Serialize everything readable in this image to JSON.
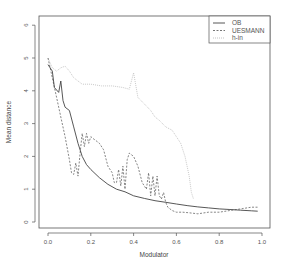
{
  "chart_data": {
    "type": "line",
    "title": "",
    "xlabel": "Modulator",
    "ylabel": "Mean distance",
    "xlim": [
      -0.04,
      1.04
    ],
    "ylim": [
      -0.24,
      6.24
    ],
    "x_ticks": [
      0.0,
      0.2,
      0.4,
      0.6,
      0.8,
      1.0
    ],
    "x_tick_labels": [
      "0.0",
      "0.2",
      "0.4",
      "0.6",
      "0.8",
      "1.0"
    ],
    "y_ticks": [
      0,
      1,
      2,
      3,
      4,
      5,
      6
    ],
    "y_tick_labels": [
      "0",
      "1",
      "2",
      "3",
      "4",
      "5",
      "6"
    ],
    "grid": false,
    "legend_position": "top-right",
    "legend": [
      "OB",
      "UESMANN",
      "h-in"
    ],
    "series": [
      {
        "name": "OB",
        "style": "solid",
        "color": "#444444",
        "x": [
          0.0,
          0.02,
          0.03,
          0.05,
          0.06,
          0.07,
          0.08,
          0.1,
          0.12,
          0.14,
          0.16,
          0.18,
          0.2,
          0.24,
          0.28,
          0.32,
          0.36,
          0.4,
          0.45,
          0.5,
          0.55,
          0.6,
          0.65,
          0.7,
          0.75,
          0.8,
          0.85,
          0.9,
          0.95,
          0.98
        ],
        "y": [
          4.8,
          4.6,
          4.1,
          3.95,
          4.3,
          3.7,
          3.5,
          3.4,
          2.9,
          2.4,
          2.0,
          1.75,
          1.6,
          1.35,
          1.15,
          1.0,
          0.92,
          0.8,
          0.72,
          0.65,
          0.6,
          0.55,
          0.5,
          0.46,
          0.43,
          0.4,
          0.38,
          0.36,
          0.34,
          0.33
        ]
      },
      {
        "name": "UESMANN",
        "style": "dashed",
        "color": "#666666",
        "x": [
          0.0,
          0.02,
          0.04,
          0.06,
          0.08,
          0.1,
          0.11,
          0.12,
          0.13,
          0.14,
          0.15,
          0.16,
          0.17,
          0.18,
          0.19,
          0.2,
          0.21,
          0.22,
          0.24,
          0.26,
          0.28,
          0.3,
          0.31,
          0.32,
          0.33,
          0.34,
          0.35,
          0.36,
          0.37,
          0.38,
          0.4,
          0.42,
          0.44,
          0.46,
          0.47,
          0.48,
          0.49,
          0.5,
          0.51,
          0.52,
          0.53,
          0.54,
          0.55,
          0.56,
          0.58,
          0.6,
          0.63,
          0.66,
          0.7,
          0.75,
          0.8,
          0.85,
          0.9,
          0.95,
          0.98
        ],
        "y": [
          5.0,
          4.4,
          3.8,
          3.2,
          2.6,
          1.9,
          1.5,
          1.45,
          1.8,
          1.4,
          2.1,
          2.7,
          2.3,
          2.7,
          2.4,
          2.6,
          2.55,
          2.5,
          2.4,
          2.2,
          1.7,
          1.5,
          1.2,
          1.2,
          1.6,
          1.1,
          1.7,
          1.0,
          1.9,
          2.1,
          2.0,
          1.7,
          1.2,
          1.0,
          1.5,
          0.8,
          1.4,
          0.8,
          1.4,
          0.8,
          0.7,
          0.9,
          0.6,
          0.45,
          0.35,
          0.3,
          0.3,
          0.28,
          0.25,
          0.3,
          0.3,
          0.35,
          0.4,
          0.45,
          0.45
        ]
      },
      {
        "name": "h-in",
        "style": "dotted",
        "color": "#bbbbbb",
        "x": [
          0.0,
          0.02,
          0.04,
          0.06,
          0.08,
          0.1,
          0.12,
          0.14,
          0.16,
          0.2,
          0.25,
          0.3,
          0.35,
          0.38,
          0.4,
          0.42,
          0.45,
          0.48,
          0.5,
          0.52,
          0.55,
          0.58,
          0.6,
          0.62,
          0.64,
          0.66,
          0.67,
          0.68
        ],
        "y": [
          5.0,
          4.7,
          4.6,
          4.7,
          4.75,
          4.6,
          4.4,
          4.3,
          4.2,
          4.2,
          4.15,
          4.15,
          4.1,
          4.05,
          4.55,
          3.8,
          3.6,
          3.4,
          3.2,
          3.1,
          2.9,
          2.8,
          2.6,
          2.4,
          2.0,
          1.4,
          0.9,
          0.7
        ]
      }
    ]
  }
}
